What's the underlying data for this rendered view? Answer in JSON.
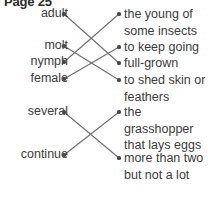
{
  "header": {
    "title": "Page 25"
  },
  "worksheet": {
    "type": "matching-exercise",
    "terms": [
      {
        "id": "adult",
        "label": "adult",
        "y": 14
      },
      {
        "id": "molt",
        "label": "molt",
        "y": 46
      },
      {
        "id": "nymph",
        "label": "nymph",
        "y": 62
      },
      {
        "id": "female",
        "label": "female",
        "y": 79
      },
      {
        "id": "several",
        "label": "several",
        "y": 112
      },
      {
        "id": "continue",
        "label": "continue",
        "y": 155
      }
    ],
    "definitions": [
      {
        "id": "young",
        "label": "the young of some insects",
        "y": 14
      },
      {
        "id": "keepgoing",
        "label": "to keep going",
        "y": 47
      },
      {
        "id": "fullgrown",
        "label": "full-grown",
        "y": 63
      },
      {
        "id": "shedskin",
        "label": "to shed skin or feathers",
        "y": 80
      },
      {
        "id": "grasshopper",
        "label": "the grasshopper that lays eggs",
        "y": 112
      },
      {
        "id": "morethan",
        "label": "more than two but not a lot",
        "y": 158
      }
    ],
    "connections": [
      {
        "from": "adult",
        "to": "fullgrown"
      },
      {
        "from": "molt",
        "to": "shedskin"
      },
      {
        "from": "nymph",
        "to": "young"
      },
      {
        "from": "female",
        "to": "keepgoing"
      },
      {
        "from": "several",
        "to": "morethan"
      },
      {
        "from": "continue",
        "to": "grasshopper"
      }
    ],
    "geometry": {
      "left_dot_x": 64,
      "right_dot_x": 119,
      "line_color": "#6e6e6e",
      "dot_color": "#4a4a4a",
      "line_width": 1.1
    }
  }
}
